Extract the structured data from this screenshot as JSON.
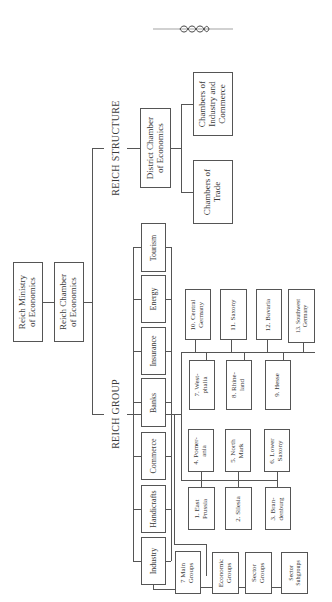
{
  "ornament": {
    "icon": "decorative-knot-rule"
  },
  "top": {
    "ministry": "Reich Ministry\nof Economics",
    "chamber": "Reich Chamber\nof Economics"
  },
  "reich_structure": {
    "label": "REICH STRUCTURE",
    "district": "District Chamber\nof Economics",
    "industry_commerce": "Chambers of\nIndustry and\nCommerce",
    "trade": "Chambers of\nTrade"
  },
  "reich_group": {
    "label": "REICH GROUP",
    "sectors": [
      "Tourism",
      "Energy",
      "Insurance",
      "Banks",
      "Commerce",
      "Handicrafts",
      "Industry"
    ],
    "regions": [
      "1. East\nPrussia",
      "2. Silesia",
      "3. Bran-\ndenburg",
      "4. Pomer-\nania",
      "5. North\nMark",
      "6. Lower\nSaxony",
      "7. West-\nphalia",
      "8. Rhine-\nland",
      "9. Hesse",
      "10. Central\nGermany",
      "11. Saxony",
      "12. Bavaria",
      "13. Southwest\nGermany"
    ],
    "industry_chain": [
      "7 Main\nGroups",
      "Economic\nGroups",
      "Sector\nGroups",
      "Sector\nSubgroups"
    ]
  }
}
